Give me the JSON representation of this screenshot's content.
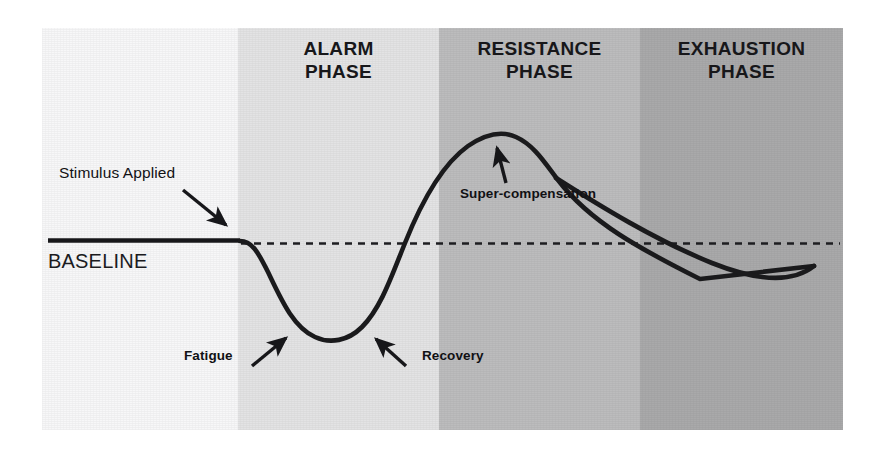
{
  "figure": {
    "baseline_label": "BASELINE",
    "phases": [
      {
        "key": "pre",
        "label": "",
        "color": "#f7f7f8",
        "x": 0,
        "width": 196
      },
      {
        "key": "alarm",
        "label": "ALARM\nPHASE",
        "color": "#e3e3e4",
        "x": 196,
        "width": 201
      },
      {
        "key": "resistance",
        "label": "RESISTANCE\nPHASE",
        "color": "#bcbcbd",
        "x": 397,
        "width": 201
      },
      {
        "key": "exhaustion",
        "label": "EXHAUSTION\nPHASE",
        "color": "#a9a9aa",
        "x": 598,
        "width": 203
      }
    ],
    "annotations": [
      {
        "key": "stimulus",
        "text": "Stimulus Applied"
      },
      {
        "key": "fatigue",
        "text": "Fatigue"
      },
      {
        "key": "recovery",
        "text": "Recovery"
      },
      {
        "key": "supercompensation",
        "text": "Super-compensation"
      }
    ],
    "colors": {
      "curve": "#1a1a1c",
      "baseline_solid": "#17171a",
      "baseline_dashed": "#1d1d20",
      "text": "#111114",
      "page_background": "#ffffff"
    }
  },
  "chart_data": {
    "type": "line",
    "xlabel": "",
    "ylabel": "",
    "grid": false,
    "legend": null,
    "baseline_value": 0,
    "baseline_label": "BASELINE",
    "x_bands": [
      {
        "name": "",
        "from": 0,
        "to": 24.5
      },
      {
        "name": "ALARM PHASE",
        "from": 24.5,
        "to": 49.6
      },
      {
        "name": "RESISTANCE PHASE",
        "from": 49.6,
        "to": 74.7
      },
      {
        "name": "EXHAUSTION PHASE",
        "from": 74.7,
        "to": 100
      }
    ],
    "series": [
      {
        "name": "Performance / Adaptation",
        "x": [
          0.8,
          10,
          20,
          24.6,
          28,
          32,
          36,
          40,
          44,
          48,
          52,
          56,
          58.2,
          62,
          66,
          70,
          74.7,
          80,
          86,
          92,
          96.5
        ],
        "y": [
          0,
          0,
          0,
          0,
          -11,
          -21,
          -26.5,
          -27.5,
          -24,
          -13,
          2,
          13,
          15.6,
          14.5,
          12,
          9,
          5.5,
          1.5,
          -2.5,
          -6,
          -8
        ]
      }
    ],
    "key_points": [
      {
        "label": "Stimulus Applied",
        "x": 24.6,
        "y": 0
      },
      {
        "label": "Fatigue",
        "x": 33.5,
        "y": -24
      },
      {
        "label": "Trough (lowest)",
        "x": 38.5,
        "y": -27.5
      },
      {
        "label": "Recovery",
        "x": 45,
        "y": -20
      },
      {
        "label": "Super-compensation",
        "x": 58.2,
        "y": 15.6
      },
      {
        "label": "Return to baseline",
        "x": 82,
        "y": 0
      }
    ],
    "ylim": [
      -34,
      24
    ],
    "xlim": [
      0,
      100
    ]
  }
}
